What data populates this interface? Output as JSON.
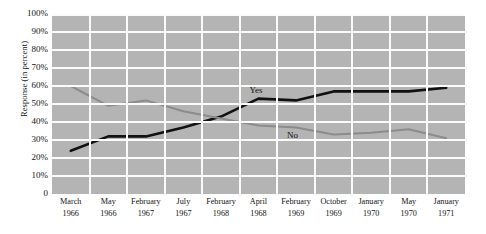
{
  "chart_data": {
    "type": "line",
    "title": "",
    "xlabel": "",
    "ylabel": "Response (in percent)",
    "ylim": [
      0,
      100
    ],
    "grid": true,
    "legend_position": "inline-labels",
    "categories": [
      "March 1966",
      "May 1966",
      "February 1967",
      "July 1967",
      "February 1968",
      "April 1968",
      "February 1969",
      "October 1969",
      "January 1970",
      "May 1970",
      "January 1971"
    ],
    "category_lines": [
      {
        "month": "March",
        "year": "1966"
      },
      {
        "month": "May",
        "year": "1966"
      },
      {
        "month": "February",
        "year": "1967"
      },
      {
        "month": "July",
        "year": "1967"
      },
      {
        "month": "February",
        "year": "1968"
      },
      {
        "month": "April",
        "year": "1968"
      },
      {
        "month": "February",
        "year": "1969"
      },
      {
        "month": "October",
        "year": "1969"
      },
      {
        "month": "January",
        "year": "1970"
      },
      {
        "month": "May",
        "year": "1970"
      },
      {
        "month": "January",
        "year": "1971"
      }
    ],
    "ytick_labels": [
      "100%",
      "90%",
      "80%",
      "70%",
      "60%",
      "50%",
      "40%",
      "30%",
      "20%",
      "10%",
      "0"
    ],
    "ytick_values": [
      100,
      90,
      80,
      70,
      60,
      50,
      40,
      30,
      20,
      10,
      0
    ],
    "series": [
      {
        "name": "Yes",
        "color": "#111111",
        "values": [
          24,
          32,
          32,
          37,
          43,
          53,
          52,
          57,
          57,
          57,
          59
        ],
        "label_x_index": 5,
        "label_text": "Yes"
      },
      {
        "name": "No",
        "color": "#8c8c8c",
        "values": [
          60,
          49,
          52,
          46,
          42,
          38,
          37,
          33,
          34,
          36,
          31
        ],
        "label_x_index": 6,
        "label_text": "No"
      }
    ],
    "colors": {
      "plot_background": "#b4b4b4",
      "gridline": "#fbfbfb",
      "yes_line": "#111111",
      "no_line": "#8c8c8c",
      "text": "#141414",
      "page_background": "#ffffff"
    }
  }
}
